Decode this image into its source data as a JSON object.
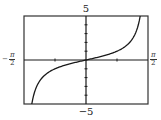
{
  "chart_data": {
    "type": "line",
    "title": "",
    "function": "y = tan(x)",
    "xlabel": "",
    "ylabel": "",
    "xlim": [
      -1.5708,
      1.5708
    ],
    "ylim": [
      -5,
      5
    ],
    "x_tick_labels": [
      "-π/2",
      "π/2"
    ],
    "y_tick_labels": [
      "5",
      "-5"
    ],
    "x_minor_ticks": [
      -0.7854,
      0.7854
    ],
    "y_minor_ticks": [
      -4,
      -3,
      -2,
      -1,
      1,
      2,
      3,
      4
    ],
    "grid": false,
    "legend": null,
    "series": [
      {
        "name": "tan(x)",
        "x": [
          -1.3734,
          -1.3,
          -1.2,
          -1.1,
          -1.0,
          -0.8,
          -0.6,
          -0.4,
          -0.2,
          0,
          0.2,
          0.4,
          0.6,
          0.8,
          1.0,
          1.1,
          1.2,
          1.3,
          1.3734
        ],
        "y": [
          -5,
          -3.602,
          -2.572,
          -1.965,
          -1.557,
          -1.03,
          -0.684,
          -0.423,
          -0.203,
          0,
          0.203,
          0.423,
          0.684,
          1.03,
          1.557,
          1.965,
          2.572,
          3.602,
          5
        ]
      }
    ],
    "colors": {
      "curve": "#1a1a1a",
      "axes": "#1a1a1a",
      "frame": "#333333"
    }
  },
  "labels": {
    "y_max": "5",
    "y_min": "−5",
    "x_min_sign": "−",
    "x_min_num": "π",
    "x_min_den": "2",
    "x_max_num": "π",
    "x_max_den": "2"
  }
}
